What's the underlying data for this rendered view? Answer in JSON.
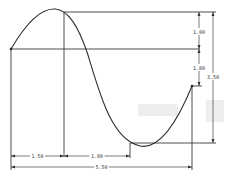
{
  "drawing": {
    "type": "sketch-dimension-drawing",
    "curve": "spline-sine-wave",
    "colors": {
      "line": "#3a3a3a",
      "curve": "#2e2e2e",
      "background": "#ffffff"
    },
    "dimensions": {
      "vertical_upper": "1.00",
      "vertical_lower": "1.00",
      "vertical_total": "3.50",
      "horizontal_first": "1.50",
      "horizontal_second": "1.80",
      "horizontal_total": "5.50"
    }
  }
}
